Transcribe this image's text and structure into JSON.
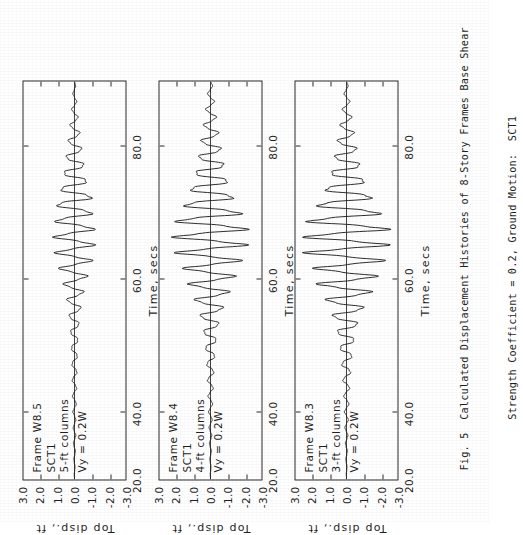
{
  "figure": {
    "caption_lines": [
      "Fig. 5  Calculated Displacement Histories of 8-Story Frames Base Shear",
      "        Strength Coefficient = 0.2, Ground Motion:  SCT1"
    ],
    "caption_label": "Fig. 5",
    "background_color": "#ffffff",
    "ink_color": "#1f1f1f"
  },
  "axes": {
    "x_title": "Time, secs",
    "y_title": "Top disp., ft",
    "x_ticks": [
      "20.0",
      "40.0",
      "60.0",
      "80.0"
    ],
    "y_ticks": [
      "3.0",
      "2.0",
      "1.0",
      "0.0",
      "-1.0",
      "-2.0",
      "-3.0"
    ],
    "xlim": [
      20.0,
      80.0
    ],
    "ylim": [
      -3.0,
      3.0
    ]
  },
  "chart_data": {
    "type": "line",
    "title": "Calculated Displacement Histories of 8-Story Frames",
    "xlabel": "Time, secs",
    "ylabel": "Top disp., ft",
    "xlim": [
      20.0,
      80.0
    ],
    "ylim": [
      -3.0,
      3.0
    ],
    "x_ticks": [
      20.0,
      40.0,
      60.0,
      80.0
    ],
    "y_ticks": [
      3.0,
      2.0,
      1.0,
      0.0,
      -1.0,
      -2.0,
      -3.0
    ],
    "grid": false,
    "legend": "none",
    "ground_motion": "SCT1",
    "base_shear_strength_coefficient": 0.2,
    "panels": [
      {
        "id": "panel-w8-5",
        "frame": "Frame W8.5",
        "ground_motion": "SCT1",
        "columns": "5-ft columns",
        "yield": "Vy = 0.2W",
        "peak_positive": 1.15,
        "peak_negative": -1.1,
        "peak_time": 62.0,
        "series": [
          {
            "name": "Top displacement W8.5",
            "x": [
              20.0,
              21.2,
              22.4,
              23.6,
              24.8,
              26.0,
              27.2,
              28.4,
              29.6,
              30.8,
              32.0,
              33.2,
              34.4,
              35.6,
              36.8,
              38.0,
              39.2,
              40.4,
              41.6,
              42.8,
              44.0,
              45.2,
              46.4,
              47.6,
              48.8,
              50.0,
              51.2,
              52.4,
              53.6,
              54.8,
              56.0,
              57.2,
              58.4,
              59.6,
              60.8,
              62.0,
              63.2,
              64.4,
              65.6,
              66.8,
              68.0,
              69.2,
              70.4,
              71.6,
              72.8,
              74.0,
              75.2,
              76.4,
              77.6,
              78.8,
              80.0
            ],
            "y": [
              0.0,
              0.02,
              -0.03,
              0.04,
              -0.05,
              0.06,
              -0.07,
              0.06,
              -0.08,
              0.09,
              -0.1,
              0.11,
              -0.12,
              0.13,
              -0.14,
              0.16,
              -0.18,
              0.2,
              -0.22,
              0.26,
              -0.3,
              0.35,
              -0.4,
              0.46,
              -0.55,
              0.64,
              -0.75,
              0.88,
              -0.98,
              1.05,
              -1.1,
              1.12,
              -1.08,
              1.05,
              -0.95,
              1.15,
              -0.9,
              0.8,
              -0.72,
              0.62,
              -0.55,
              0.46,
              -0.4,
              0.33,
              -0.27,
              0.22,
              -0.17,
              0.13,
              -0.1,
              0.07,
              -0.04
            ]
          }
        ]
      },
      {
        "id": "panel-w8-4",
        "frame": "Frame W8.4",
        "ground_motion": "SCT1",
        "columns": "4-ft columns",
        "yield": "Vy = 0.2W",
        "peak_positive": 2.05,
        "peak_negative": -1.95,
        "peak_time": 59.5,
        "series": [
          {
            "name": "Top displacement W8.4",
            "x": [
              20.0,
              21.2,
              22.4,
              23.6,
              24.8,
              26.0,
              27.2,
              28.4,
              29.6,
              30.8,
              32.0,
              33.2,
              34.4,
              35.6,
              36.8,
              38.0,
              39.2,
              40.4,
              41.6,
              42.8,
              44.0,
              45.2,
              46.4,
              47.6,
              48.8,
              50.0,
              51.2,
              52.4,
              53.6,
              54.8,
              56.0,
              57.2,
              58.4,
              59.6,
              60.8,
              62.0,
              63.2,
              64.4,
              65.6,
              66.8,
              68.0,
              69.2,
              70.4,
              71.6,
              72.8,
              74.0,
              75.2,
              76.4,
              77.6,
              78.8,
              80.0
            ],
            "y": [
              0.0,
              0.02,
              -0.03,
              0.04,
              -0.05,
              0.06,
              -0.07,
              0.08,
              -0.09,
              0.1,
              -0.12,
              0.14,
              -0.16,
              0.18,
              -0.2,
              0.24,
              -0.28,
              0.33,
              -0.38,
              0.46,
              -0.55,
              0.66,
              -0.8,
              0.95,
              -1.1,
              1.25,
              -1.35,
              1.5,
              -1.7,
              1.95,
              -1.9,
              2.05,
              -1.95,
              1.85,
              -1.6,
              1.45,
              -1.3,
              1.15,
              -1.0,
              0.9,
              -0.78,
              0.68,
              -0.58,
              0.5,
              -0.42,
              0.35,
              -0.29,
              0.23,
              -0.18,
              0.13,
              -0.08
            ]
          }
        ]
      },
      {
        "id": "panel-w8-3",
        "frame": "Frame W8.3",
        "ground_motion": "SCT1",
        "columns": "3-ft columns",
        "yield": "Vy = 0.2W",
        "peak_positive": 2.3,
        "peak_negative": -2.25,
        "peak_time": 60.5,
        "series": [
          {
            "name": "Top displacement W8.3",
            "x": [
              20.0,
              21.2,
              22.4,
              23.6,
              24.8,
              26.0,
              27.2,
              28.4,
              29.6,
              30.8,
              32.0,
              33.2,
              34.4,
              35.6,
              36.8,
              38.0,
              39.2,
              40.4,
              41.6,
              42.8,
              44.0,
              45.2,
              46.4,
              47.6,
              48.8,
              50.0,
              51.2,
              52.4,
              53.6,
              54.8,
              56.0,
              57.2,
              58.4,
              59.6,
              60.8,
              62.0,
              63.2,
              64.4,
              65.6,
              66.8,
              68.0,
              69.2,
              70.4,
              71.6,
              72.8,
              74.0,
              75.2,
              76.4,
              77.6,
              78.8,
              80.0
            ],
            "y": [
              0.0,
              0.02,
              -0.03,
              0.04,
              -0.05,
              0.06,
              -0.08,
              0.09,
              -0.1,
              0.12,
              -0.14,
              0.16,
              -0.19,
              0.22,
              -0.26,
              0.3,
              -0.36,
              0.44,
              -0.52,
              0.62,
              -0.75,
              0.9,
              -1.05,
              1.25,
              -1.45,
              1.7,
              -1.55,
              1.85,
              -2.1,
              2.25,
              -2.2,
              2.3,
              -2.25,
              2.0,
              -1.8,
              1.6,
              -1.4,
              1.2,
              -1.05,
              0.9,
              -0.78,
              0.66,
              -0.56,
              0.47,
              -0.39,
              0.32,
              -0.26,
              0.2,
              -0.15,
              0.1,
              -0.06
            ]
          }
        ]
      }
    ]
  }
}
